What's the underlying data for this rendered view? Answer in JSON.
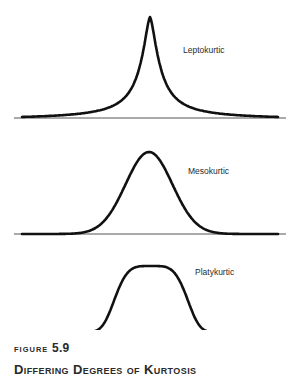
{
  "chart_data": [
    {
      "type": "line",
      "name": "leptokurtic",
      "label": "Leptokurtic",
      "distribution": "peaked, heavy-tailed",
      "x_range": [
        -4,
        4
      ],
      "relative_peak_height": 1.0,
      "shape": "laplace-like sharp peak"
    },
    {
      "type": "line",
      "name": "mesokurtic",
      "label": "Mesokurtic",
      "distribution": "normal",
      "x_range": [
        -4,
        4
      ],
      "relative_peak_height": 0.8,
      "shape": "gaussian bell curve"
    },
    {
      "type": "line",
      "name": "platykurtic",
      "label": "Platykurtic",
      "distribution": "flat-topped, light-tailed",
      "x_range": [
        -4,
        4
      ],
      "relative_peak_height": 0.65,
      "shape": "flat plateau with steep shoulders"
    }
  ],
  "caption": {
    "figure_prefix": "FIGURE",
    "figure_number": "5.9",
    "title": "Differing Degrees of Kurtosis"
  },
  "colors": {
    "curve": "#111111",
    "baseline": "#555555",
    "text": "#2a2a2a"
  }
}
